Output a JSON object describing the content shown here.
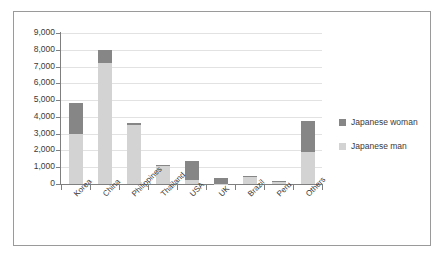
{
  "chart_data": {
    "type": "bar",
    "subtype": "stacked-vertical",
    "title": "",
    "xlabel": "",
    "ylabel": "",
    "ylim": [
      0,
      9000
    ],
    "ytick_step": 1000,
    "ytick_labels": [
      "9,000",
      "8,000",
      "7,000",
      "6,000",
      "5,000",
      "4,000",
      "3,000",
      "2,000",
      "1,000",
      "0"
    ],
    "grid": true,
    "legend_position": "right",
    "categories": [
      "Korea",
      "China",
      "Philippines",
      "Thailand",
      "USA",
      "UK",
      "Brazil",
      "Peru",
      "Others"
    ],
    "series": [
      {
        "name": "Japanese man",
        "color": "#d3d3d3",
        "values": [
          3000,
          7200,
          3500,
          1080,
          250,
          30,
          450,
          170,
          1900
        ]
      },
      {
        "name": "Japanese woman",
        "color": "#868686",
        "values": [
          1800,
          800,
          150,
          60,
          1100,
          320,
          20,
          10,
          1850
        ]
      }
    ],
    "totals": [
      4800,
      8000,
      3650,
      1140,
      1350,
      350,
      470,
      180,
      3750
    ]
  },
  "legend": {
    "items": [
      {
        "label": "Japanese woman",
        "swatch": "#868686"
      },
      {
        "label": "Japanese man",
        "swatch": "#d3d3d3"
      }
    ]
  },
  "colors": {
    "woman": "#868686",
    "man": "#d3d3d3",
    "grid": "#e2e2e2",
    "axis": "#7f7f7f",
    "border": "#9a9a9a",
    "text": "#3a3a3a"
  }
}
